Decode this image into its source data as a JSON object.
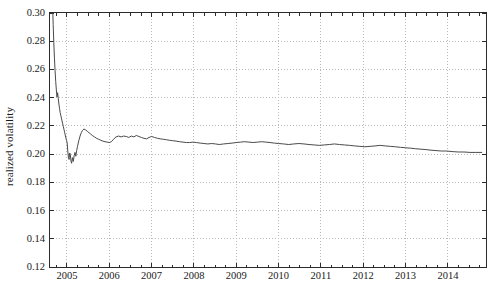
{
  "figure": {
    "width": 498,
    "height": 293,
    "background": "#ffffff",
    "axis_color": "#2b2b2b",
    "grid_color": "#b9b9b9",
    "line_color": "#4a4a4a",
    "caption": ""
  },
  "chart_data": {
    "type": "line",
    "title": "",
    "xlabel": "",
    "ylabel": "realized volatility",
    "xlim": [
      2004.6,
      2014.9
    ],
    "ylim": [
      0.12,
      0.3
    ],
    "grid": true,
    "grid_style": "dotted",
    "legend": null,
    "ytick_labels": [
      "0.12",
      "0.14",
      "0.16",
      "0.18",
      "0.20",
      "0.22",
      "0.24",
      "0.26",
      "0.28",
      "0.30"
    ],
    "yticks": [
      0.12,
      0.14,
      0.16,
      0.18,
      0.2,
      0.22,
      0.24,
      0.26,
      0.28,
      0.3
    ],
    "xtick_labels": [
      "2005",
      "2006",
      "2007",
      "2008",
      "2009",
      "2010",
      "2011",
      "2012",
      "2013",
      "2014"
    ],
    "xticks": [
      2005,
      2006,
      2007,
      2008,
      2009,
      2010,
      2011,
      2012,
      2013,
      2014
    ],
    "series": [
      {
        "name": "realized volatility",
        "color": "#4a4a4a",
        "x": [
          2004.63,
          2004.645,
          2004.66,
          2004.675,
          2004.69,
          2004.705,
          2004.72,
          2004.735,
          2004.75,
          2004.765,
          2004.78,
          2004.795,
          2004.81,
          2004.825,
          2004.84,
          2004.855,
          2004.87,
          2004.885,
          2004.9,
          2004.915,
          2004.93,
          2004.945,
          2004.96,
          2004.975,
          2004.99,
          2005.005,
          2005.02,
          2005.035,
          2005.05,
          2005.065,
          2005.08,
          2005.095,
          2005.11,
          2005.13,
          2005.15,
          2005.17,
          2005.19,
          2005.21,
          2005.23,
          2005.25,
          2005.28,
          2005.31,
          2005.34,
          2005.37,
          2005.4,
          2005.44,
          2005.48,
          2005.52,
          2005.56,
          2005.6,
          2005.65,
          2005.7,
          2005.75,
          2005.8,
          2005.85,
          2005.9,
          2005.95,
          2006.0,
          2006.05,
          2006.1,
          2006.16,
          2006.22,
          2006.28,
          2006.34,
          2006.4,
          2006.46,
          2006.52,
          2006.58,
          2006.64,
          2006.7,
          2006.76,
          2006.82,
          2006.88,
          2006.94,
          2007.0,
          2007.07,
          2007.14,
          2007.21,
          2007.28,
          2007.35,
          2007.42,
          2007.5,
          2007.58,
          2007.66,
          2007.74,
          2007.82,
          2007.9,
          2007.98,
          2008.06,
          2008.15,
          2008.24,
          2008.33,
          2008.42,
          2008.51,
          2008.6,
          2008.7,
          2008.8,
          2008.9,
          2009.0,
          2009.1,
          2009.2,
          2009.3,
          2009.4,
          2009.5,
          2009.6,
          2009.7,
          2009.8,
          2009.9,
          2010.0,
          2010.12,
          2010.24,
          2010.36,
          2010.48,
          2010.6,
          2010.72,
          2010.84,
          2010.96,
          2011.08,
          2011.2,
          2011.32,
          2011.44,
          2011.56,
          2011.68,
          2011.8,
          2011.92,
          2012.04,
          2012.16,
          2012.28,
          2012.4,
          2012.52,
          2012.64,
          2012.76,
          2012.88,
          2013.0,
          2013.12,
          2013.24,
          2013.36,
          2013.48,
          2013.6,
          2013.72,
          2013.84,
          2013.96,
          2014.1,
          2014.24,
          2014.38,
          2014.52,
          2014.66,
          2014.8
        ],
        "y": [
          0.345,
          0.326,
          0.308,
          0.292,
          0.279,
          0.268,
          0.259,
          0.2515,
          0.2455,
          0.2405,
          0.2435,
          0.2395,
          0.2355,
          0.2325,
          0.2295,
          0.2275,
          0.2255,
          0.2235,
          0.2215,
          0.2195,
          0.2175,
          0.2155,
          0.2135,
          0.2115,
          0.2098,
          0.2082,
          0.2022,
          0.1978,
          0.1962,
          0.2008,
          0.1998,
          0.1952,
          0.1935,
          0.1975,
          0.1948,
          0.1988,
          0.2012,
          0.1985,
          0.2025,
          0.2055,
          0.2095,
          0.2128,
          0.2152,
          0.2168,
          0.2178,
          0.2172,
          0.2162,
          0.2152,
          0.2142,
          0.2132,
          0.2122,
          0.2112,
          0.2105,
          0.2098,
          0.2092,
          0.2088,
          0.2085,
          0.2082,
          0.2088,
          0.2105,
          0.2122,
          0.2128,
          0.2122,
          0.2128,
          0.2125,
          0.2118,
          0.2128,
          0.2122,
          0.2132,
          0.2125,
          0.2118,
          0.2112,
          0.2108,
          0.2118,
          0.2125,
          0.2118,
          0.2112,
          0.2108,
          0.2105,
          0.2102,
          0.2098,
          0.2095,
          0.2092,
          0.2088,
          0.2085,
          0.2082,
          0.2082,
          0.2085,
          0.2082,
          0.2078,
          0.2075,
          0.2072,
          0.2075,
          0.2072,
          0.2068,
          0.2072,
          0.2075,
          0.2078,
          0.2082,
          0.2085,
          0.2088,
          0.2085,
          0.2082,
          0.2085,
          0.2088,
          0.2085,
          0.2082,
          0.2078,
          0.2075,
          0.2072,
          0.2068,
          0.2072,
          0.2075,
          0.2072,
          0.2068,
          0.2065,
          0.2062,
          0.2065,
          0.2068,
          0.2072,
          0.2068,
          0.2065,
          0.2062,
          0.2058,
          0.2055,
          0.2052,
          0.2055,
          0.2058,
          0.2062,
          0.2058,
          0.2055,
          0.2052,
          0.2048,
          0.2045,
          0.2042,
          0.2038,
          0.2035,
          0.2032,
          0.2028,
          0.2025,
          0.2022,
          0.2022,
          0.2018,
          0.2015,
          0.2015,
          0.2012,
          0.2012,
          0.2012
        ]
      }
    ]
  }
}
